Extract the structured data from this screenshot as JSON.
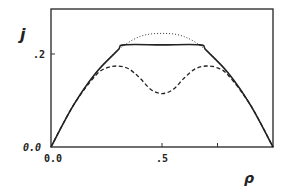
{
  "chart_data": {
    "type": "line",
    "title": "",
    "xlabel": "ρ",
    "ylabel": "j",
    "xlim": [
      0,
      1
    ],
    "ylim": [
      0,
      0.3
    ],
    "xticks": [
      0,
      0.25,
      0.5,
      0.75,
      1
    ],
    "xtick_labels": [
      "0.0",
      "",
      ".5",
      "",
      ""
    ],
    "yticks": [
      0,
      0.2
    ],
    "ytick_labels": [
      "0.0",
      ".2"
    ],
    "grid": false,
    "legend": null,
    "series": [
      {
        "name": "dotted",
        "style": "dotted",
        "x": [
          0,
          0.1,
          0.2,
          0.3,
          0.4,
          0.5,
          0.6,
          0.7,
          0.8,
          0.9,
          1.0
        ],
        "values": [
          0,
          0.09,
          0.16,
          0.21,
          0.24,
          0.247,
          0.24,
          0.21,
          0.16,
          0.09,
          0
        ]
      },
      {
        "name": "solid",
        "style": "solid",
        "x": [
          0,
          0.1,
          0.2,
          0.3,
          0.33,
          0.5,
          0.67,
          0.7,
          0.8,
          0.9,
          1.0
        ],
        "values": [
          0,
          0.09,
          0.16,
          0.21,
          0.222,
          0.222,
          0.222,
          0.21,
          0.16,
          0.09,
          0
        ]
      },
      {
        "name": "dashed",
        "style": "dashed",
        "x": [
          0,
          0.1,
          0.2,
          0.25,
          0.3,
          0.35,
          0.4,
          0.45,
          0.5,
          0.55,
          0.6,
          0.65,
          0.7,
          0.75,
          0.8,
          0.9,
          1.0
        ],
        "values": [
          0,
          0.09,
          0.155,
          0.172,
          0.176,
          0.17,
          0.15,
          0.125,
          0.116,
          0.125,
          0.15,
          0.17,
          0.176,
          0.172,
          0.155,
          0.09,
          0
        ]
      }
    ]
  },
  "labels": {
    "y_axis": "j",
    "x_axis": "ρ",
    "y_tick_0": "0.0",
    "y_tick_1": ".2",
    "x_tick_0": "0.0",
    "x_tick_1": ".5"
  }
}
